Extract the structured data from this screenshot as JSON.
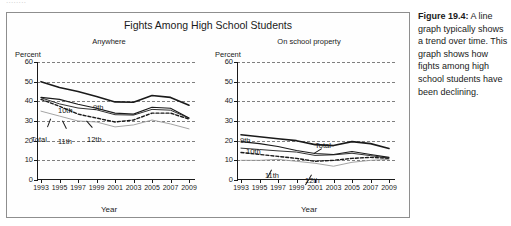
{
  "top_ghost": "........",
  "figure": {
    "title": "Fights Among High School Students",
    "panels": [
      {
        "subtitle": "Anywhere",
        "yaxis_unit": "Percent",
        "xaxis_label": "Year"
      },
      {
        "subtitle": "On school property",
        "yaxis_unit": "Percent",
        "xaxis_label": "Year"
      }
    ]
  },
  "caption": {
    "label": "Figure 19.4:",
    "text": " A line graph typically shows a trend over time. This graph shows how fights among high school students have been declining."
  },
  "colors": {
    "ink": "#1a1a1a",
    "grid": "#7f7f7f",
    "light_series": "#9a9a9a",
    "frame": "#8e8e8e",
    "background": "#ffffff"
  },
  "chart_data": [
    {
      "type": "line",
      "title": "Fights Among High School Students",
      "subtitle": "Anywhere",
      "xlabel": "Year",
      "ylabel": "Percent",
      "x": [
        1993,
        1995,
        1997,
        1999,
        2001,
        2003,
        2005,
        2007,
        2009
      ],
      "xtick_labels": [
        "1993",
        "1995",
        "1997",
        "1999",
        "2001",
        "2003",
        "2005",
        "2007",
        "2009"
      ],
      "ylim": [
        0,
        60
      ],
      "ytick_labels": [
        "0",
        "10",
        "20",
        "30",
        "40",
        "50",
        "60"
      ],
      "grid": true,
      "legend": "inline-labels",
      "series": [
        {
          "name": "9th",
          "style": "solid-bold",
          "values": [
            50.0,
            47.0,
            45.0,
            42.5,
            39.7,
            39.5,
            43.0,
            42.0,
            38.0
          ]
        },
        {
          "name": "10th",
          "style": "solid",
          "values": [
            42.0,
            41.0,
            38.5,
            36.5,
            34.0,
            33.5,
            37.0,
            36.5,
            31.5
          ]
        },
        {
          "name": "Total",
          "style": "solid-thin",
          "values": [
            41.8,
            38.7,
            36.6,
            35.7,
            33.2,
            33.0,
            35.9,
            35.5,
            31.5
          ]
        },
        {
          "name": "11th",
          "style": "dashed",
          "values": [
            41.0,
            37.5,
            33.5,
            31.5,
            29.5,
            30.5,
            34.0,
            34.0,
            31.0
          ]
        },
        {
          "name": "12th",
          "style": "light",
          "values": [
            35.0,
            32.5,
            30.0,
            29.5,
            27.0,
            28.0,
            30.5,
            28.5,
            26.0
          ]
        }
      ]
    },
    {
      "type": "line",
      "title": "Fights Among High School Students",
      "subtitle": "On school property",
      "xlabel": "Year",
      "ylabel": "Percent",
      "x": [
        1993,
        1995,
        1997,
        1999,
        2001,
        2003,
        2005,
        2007,
        2009
      ],
      "xtick_labels": [
        "1993",
        "1995",
        "1997",
        "1999",
        "2001",
        "2003",
        "2005",
        "2007",
        "2009"
      ],
      "ylim": [
        0,
        60
      ],
      "ytick_labels": [
        "0",
        "10",
        "20",
        "30",
        "40",
        "50",
        "60"
      ],
      "grid": true,
      "legend": "inline-labels",
      "series": [
        {
          "name": "9th",
          "style": "solid-bold",
          "values": [
            23.0,
            22.0,
            21.0,
            20.0,
            18.0,
            17.5,
            19.5,
            18.5,
            16.0
          ]
        },
        {
          "name": "10th",
          "style": "solid",
          "values": [
            19.5,
            18.5,
            17.0,
            15.0,
            13.5,
            13.0,
            14.5,
            13.0,
            11.5
          ]
        },
        {
          "name": "Total",
          "style": "solid-thin",
          "values": [
            16.2,
            15.5,
            14.8,
            14.2,
            12.5,
            12.8,
            13.6,
            12.4,
            11.1
          ]
        },
        {
          "name": "11th",
          "style": "dashed",
          "values": [
            14.0,
            13.0,
            12.0,
            11.0,
            9.5,
            10.0,
            11.0,
            11.5,
            11.0
          ]
        },
        {
          "name": "12th",
          "style": "light",
          "values": [
            10.0,
            10.0,
            10.5,
            9.5,
            8.5,
            7.0,
            9.0,
            10.0,
            10.5
          ]
        }
      ]
    }
  ],
  "series_labels": [
    {
      "panel": 0,
      "name": "10th",
      "x": 58,
      "y": 106
    },
    {
      "panel": 0,
      "name": "9th",
      "x": 93,
      "y": 103
    },
    {
      "panel": 0,
      "name": "Total",
      "x": 31,
      "y": 135
    },
    {
      "panel": 0,
      "name": "11th",
      "x": 58,
      "y": 137
    },
    {
      "panel": 0,
      "name": "12th",
      "x": 87,
      "y": 135
    },
    {
      "panel": 1,
      "name": "9th",
      "x": 240,
      "y": 136
    },
    {
      "panel": 1,
      "name": "10th",
      "x": 246,
      "y": 147
    },
    {
      "panel": 1,
      "name": "Total",
      "x": 315,
      "y": 141
    },
    {
      "panel": 1,
      "name": "11th",
      "x": 265,
      "y": 171
    },
    {
      "panel": 1,
      "name": "12th",
      "x": 305,
      "y": 176
    }
  ]
}
